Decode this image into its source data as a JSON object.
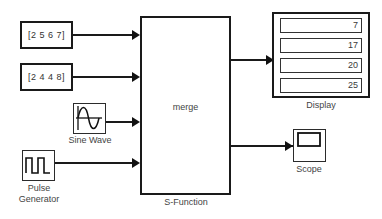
{
  "diagram": {
    "background_color": "#ffffff",
    "line_color": "#1a1a1a"
  },
  "blocks": {
    "constant_1": {
      "value": "[2 5 6 7]",
      "name": "constant-block-1"
    },
    "constant_2": {
      "value": "[2 4 4 8]",
      "name": "constant-block-2"
    },
    "sine_wave": {
      "label": "Sine Wave",
      "icon": "sine-wave-icon"
    },
    "pulse_generator": {
      "label_line1": "Pulse",
      "label_line2": "Generator",
      "icon": "pulse-wave-icon"
    },
    "s_function": {
      "inner_label": "merge",
      "caption": "S-Function"
    },
    "display": {
      "caption": "Display",
      "values": [
        "7",
        "17",
        "20",
        "25"
      ]
    },
    "scope": {
      "caption": "Scope",
      "icon": "scope-screen-icon"
    }
  },
  "signals": {
    "in_1": "constant-1-to-s-function",
    "in_2": "constant-2-to-s-function",
    "in_3": "sine-wave-to-s-function",
    "in_4": "pulse-generator-to-s-function",
    "out_1": "s-function-to-display",
    "out_2": "s-function-to-scope"
  }
}
